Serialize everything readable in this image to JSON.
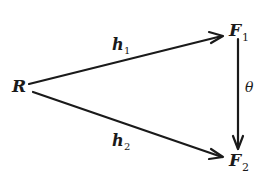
{
  "diagram": {
    "type": "commutative-diagram",
    "nodes": [
      {
        "id": "R",
        "label": "R",
        "subscript": ""
      },
      {
        "id": "F1",
        "label": "F",
        "subscript": "1"
      },
      {
        "id": "F2",
        "label": "F",
        "subscript": "2"
      }
    ],
    "edges": [
      {
        "from": "R",
        "to": "F1",
        "label": "h",
        "subscript": "1"
      },
      {
        "from": "R",
        "to": "F2",
        "label": "h",
        "subscript": "2"
      },
      {
        "from": "F1",
        "to": "F2",
        "label": "θ",
        "subscript": ""
      }
    ],
    "colors": {
      "ink": "#1a1a1a",
      "background": "#ffffff"
    }
  }
}
